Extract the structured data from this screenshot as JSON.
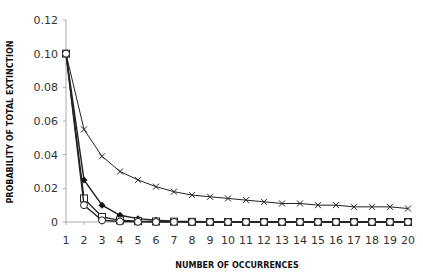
{
  "chart_data": {
    "type": "line",
    "title": "",
    "xlabel": "NUMBER OF OCCURRENCES",
    "ylabel": "PROBABILITY OF TOTAL EXTINCTION",
    "x": [
      1,
      2,
      3,
      4,
      5,
      6,
      7,
      8,
      9,
      10,
      11,
      12,
      13,
      14,
      15,
      16,
      17,
      18,
      19,
      20
    ],
    "xticks": [
      "1",
      "2",
      "3",
      "4",
      "5",
      "6",
      "7",
      "8",
      "9",
      "10",
      "11",
      "12",
      "13",
      "14",
      "15",
      "16",
      "17",
      "18",
      "19",
      "20"
    ],
    "yticks": [
      "0",
      "0.02",
      "0.04",
      "0.06",
      "0.08",
      "0.10",
      "0.12"
    ],
    "ylim": [
      0,
      0.12
    ],
    "xlim": [
      1,
      20
    ],
    "grid": false,
    "legend": null,
    "series": [
      {
        "name": "cross",
        "marker": "x",
        "values": [
          0.1,
          0.055,
          0.039,
          0.03,
          0.025,
          0.021,
          0.018,
          0.016,
          0.015,
          0.014,
          0.013,
          0.012,
          0.011,
          0.011,
          0.01,
          0.01,
          0.009,
          0.009,
          0.009,
          0.008
        ]
      },
      {
        "name": "diamond",
        "marker": "diamond-filled",
        "values": [
          0.1,
          0.025,
          0.01,
          0.004,
          0.002,
          0.001,
          0.0005,
          0.0003,
          0.0002,
          0.0001,
          0.0001,
          0.0001,
          0.0,
          0.0,
          0.0,
          0.0,
          0.0,
          0.0,
          0.0,
          0.0
        ]
      },
      {
        "name": "square",
        "marker": "square-open",
        "values": [
          0.1,
          0.014,
          0.003,
          0.001,
          0.0005,
          0.0003,
          0.0002,
          0.0001,
          0.0,
          0.0,
          0.0,
          0.0,
          0.0,
          0.0,
          0.0,
          0.0,
          0.0,
          0.0,
          0.0,
          0.0
        ]
      },
      {
        "name": "circle",
        "marker": "circle-open",
        "values": [
          0.1,
          0.01,
          0.001,
          0.0003,
          0.0001,
          0.0,
          0.0,
          0.0,
          0.0,
          0.0,
          0.0,
          0.0,
          0.0,
          0.0,
          0.0,
          0.0,
          0.0,
          0.0,
          0.0,
          0.0
        ]
      }
    ]
  }
}
